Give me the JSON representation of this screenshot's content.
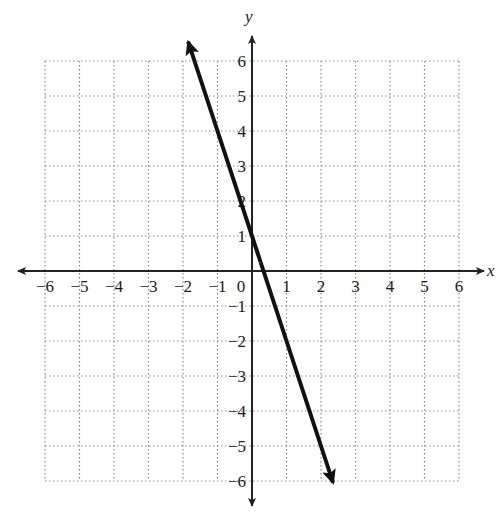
{
  "chart_data": {
    "type": "line",
    "title": "",
    "xlabel": "x",
    "ylabel": "y",
    "xlim": [
      -6,
      6
    ],
    "ylim": [
      -6,
      6
    ],
    "grid": true,
    "grid_style": "dotted",
    "x_ticks": [
      "−6",
      "−5",
      "−4",
      "−3",
      "−2",
      "−1",
      "0",
      "1",
      "2",
      "3",
      "4",
      "5",
      "6"
    ],
    "y_ticks": [
      "6",
      "5",
      "4",
      "3",
      "2",
      "1",
      "−1",
      "−2",
      "−3",
      "−4",
      "−5",
      "−6"
    ],
    "origin_label": "0",
    "series": [
      {
        "name": "line",
        "equation": "y = -3x + 1",
        "slope": -3,
        "intercept": 1,
        "x": [
          -1.85,
          0,
          1,
          2.35
        ],
        "y": [
          6.55,
          1,
          -2,
          -6.05
        ],
        "arrows": "both ends",
        "color": "#111111"
      }
    ]
  },
  "colors": {
    "axis": "#222222",
    "grid": "#8a8a8a",
    "line": "#111111",
    "background": "#ffffff"
  }
}
